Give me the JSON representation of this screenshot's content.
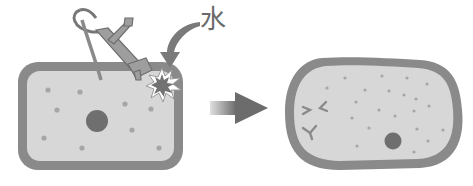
{
  "diagram": {
    "water_label": "水",
    "colors": {
      "membrane": "#8a8a8a",
      "cytoplasm": "#d7d7d7",
      "nucleus": "#6f6f6f",
      "dots": "#a6a6a6",
      "burst": "#7a7a7a",
      "pump": "#9a9a9a",
      "arrow": "#777777",
      "text": "#6a6a6a"
    },
    "panels": [
      {
        "name": "intact-cell",
        "description": "Rectangular cell with nucleus and scattered particles; a pump injects water at the top-right corner"
      },
      {
        "name": "swollen-cell",
        "description": "Rounded, swollen cell with disrupted contents and displaced nucleus"
      }
    ],
    "transition": "right-arrow"
  }
}
